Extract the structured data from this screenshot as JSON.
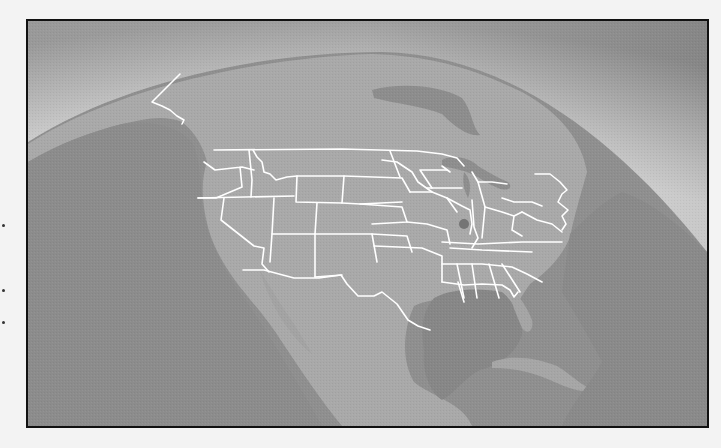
{
  "map": {
    "title": "",
    "region": "North America",
    "view": "orbital globe view",
    "colors": {
      "page_background": "#f3f3f3",
      "frame_border": "#111111",
      "space_dark": "#8c8c8c",
      "atmosphere_glow": "#e2e2e2",
      "land": "#a8a8a8",
      "ocean": "#8e8e8e",
      "ocean_deep": "#868686",
      "border_lines": "#ffffff",
      "marker": "#6e6e6e"
    },
    "marker": {
      "label": "",
      "approx_location": "Illinois / Chicago region",
      "x": 462,
      "y": 222
    },
    "features": [
      "US state borders",
      "US-Canada border",
      "US-Mexico border",
      "Alaska-Canada border",
      "Great Lakes",
      "Hudson Bay",
      "Gulf of Mexico",
      "Cuba",
      "Baja California"
    ]
  }
}
